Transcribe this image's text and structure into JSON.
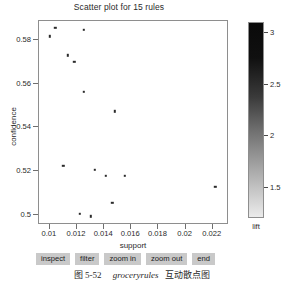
{
  "chart_data": {
    "type": "scatter",
    "title": "Scatter plot for 15 rules",
    "xlabel": "support",
    "ylabel": "confidence",
    "xlim": [
      0.0092,
      0.0232
    ],
    "ylim": [
      0.4955,
      0.5885
    ],
    "xticks": [
      "0.01",
      "0.012",
      "0.014",
      "0.016",
      "0.018",
      "0.02",
      "0.022"
    ],
    "xtick_values": [
      0.01,
      0.012,
      0.014,
      0.016,
      0.018,
      0.02,
      0.022
    ],
    "yticks": [
      "0.5",
      "0.52",
      "0.54",
      "0.56",
      "0.58"
    ],
    "ytick_values": [
      0.5,
      0.52,
      0.54,
      0.56,
      0.58
    ],
    "grid": false,
    "n_rules": 15,
    "x": [
      0.0104,
      0.01,
      0.0125,
      0.0113,
      0.0118,
      0.0125,
      0.0148,
      0.011,
      0.0133,
      0.0141,
      0.0155,
      0.0222,
      0.0146,
      0.0122,
      0.013
    ],
    "y": [
      0.5855,
      0.5815,
      0.5845,
      0.5728,
      0.57,
      0.5563,
      0.5473,
      0.5225,
      0.5207,
      0.518,
      0.518,
      0.5128,
      0.5055,
      0.5005,
      0.4995
    ],
    "lift": [
      3.0,
      2.9,
      2.55,
      2.3,
      2.1,
      2.0,
      1.85,
      1.7,
      1.6,
      1.55,
      1.5,
      1.45,
      1.4,
      1.35,
      1.3
    ],
    "colorbar": {
      "title": "lift",
      "ticks": [
        "3",
        "2.5",
        "2",
        "1.5"
      ],
      "tick_values": [
        3,
        2.5,
        2,
        1.5
      ],
      "range": [
        1.2,
        3.1
      ],
      "high_color": "#0a0a0a",
      "low_color": "#ebebeb",
      "position": "right"
    },
    "point_color": "#2b2b2b",
    "frame_color": "#8e8e8e"
  },
  "controls": {
    "buttons": [
      {
        "label": "inspect",
        "name": "inspect-button"
      },
      {
        "label": "filter",
        "name": "filter-button"
      },
      {
        "label": "zoom in",
        "name": "zoom-in-button"
      },
      {
        "label": "zoom out",
        "name": "zoom-out-button"
      },
      {
        "label": "end",
        "name": "end-button"
      }
    ],
    "button_bg": "#c9c9c9"
  },
  "caption": {
    "figure_number": "图 5-52",
    "object_name": "groceryrules",
    "description": "互动散点图"
  }
}
